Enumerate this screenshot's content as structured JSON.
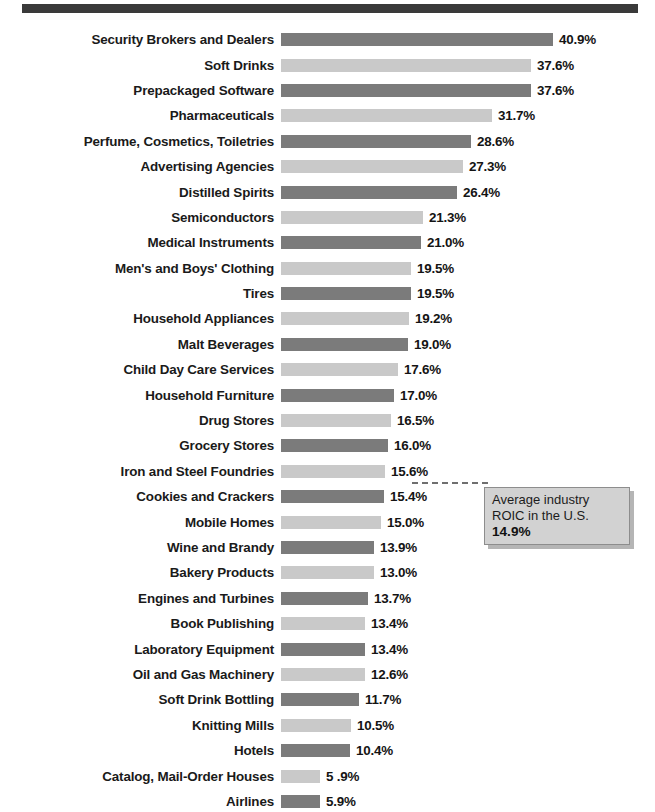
{
  "chart_data": {
    "type": "bar",
    "title": "",
    "xlabel": "",
    "ylabel": "",
    "orientation": "horizontal",
    "grid": false,
    "legend": null,
    "xlim": [
      0,
      40.9
    ],
    "value_suffix": "%",
    "categories": [
      "Security Brokers and Dealers",
      "Soft Drinks",
      "Prepackaged Software",
      "Pharmaceuticals",
      "Perfume, Cosmetics, Toiletries",
      "Advertising Agencies",
      "Distilled Spirits",
      "Semiconductors",
      "Medical Instruments",
      "Men's and Boys' Clothing",
      "Tires",
      "Household Appliances",
      "Malt Beverages",
      "Child Day Care Services",
      "Household Furniture",
      "Drug Stores",
      "Grocery Stores",
      "Iron and Steel Foundries",
      "Cookies and Crackers",
      "Mobile Homes",
      "Wine and Brandy",
      "Bakery Products",
      "Engines and Turbines",
      "Book Publishing",
      "Laboratory Equipment",
      "Oil and Gas Machinery",
      "Soft Drink Bottling",
      "Knitting Mills",
      "Hotels",
      "Catalog, Mail-Order Houses",
      "Airlines"
    ],
    "values": [
      40.9,
      37.6,
      37.6,
      31.7,
      28.6,
      27.3,
      26.4,
      21.3,
      21.0,
      19.5,
      19.5,
      19.2,
      19.0,
      17.6,
      17.0,
      16.5,
      16.0,
      15.6,
      15.4,
      15.0,
      13.9,
      13.0,
      13.7,
      13.4,
      13.4,
      12.6,
      11.7,
      10.5,
      10.4,
      5.9,
      5.9
    ],
    "value_labels": [
      "40.9%",
      "37.6%",
      "37.6%",
      "31.7%",
      "28.6%",
      "27.3%",
      "26.4%",
      "21.3%",
      "21.0%",
      "19.5%",
      "19.5%",
      "19.2%",
      "19.0%",
      "17.6%",
      "17.0%",
      "16.5%",
      "16.0%",
      "15.6%",
      "15.4%",
      "15.0%",
      "13.9%",
      "13.0%",
      "13.7%",
      "13.4%",
      "13.4%",
      "12.6%",
      "11.7%",
      "10.5%",
      "10.4%",
      "5 .9%",
      "5.9%"
    ],
    "bar_shades": [
      "dark",
      "light",
      "dark",
      "light",
      "dark",
      "light",
      "dark",
      "light",
      "dark",
      "light",
      "dark",
      "light",
      "dark",
      "light",
      "dark",
      "light",
      "dark",
      "light",
      "dark",
      "light",
      "dark",
      "light",
      "dark",
      "light",
      "dark",
      "light",
      "dark",
      "light",
      "dark",
      "light",
      "dark"
    ],
    "bar_widths_px": [
      272,
      250,
      250,
      211,
      190,
      182,
      176,
      142,
      140,
      130,
      130,
      128,
      127,
      117,
      113,
      110,
      107,
      104,
      103,
      100,
      93,
      93,
      87,
      84,
      84,
      84,
      78,
      70,
      69,
      39,
      39
    ],
    "annotation": {
      "line1": "Average industry",
      "line2": "ROIC in the U.S.",
      "value": "14.9%",
      "attached_between": [
        "Mobile Homes",
        "Wine and Brandy"
      ]
    },
    "colors": {
      "bar_dark": "#7b7b7b",
      "bar_light": "#c9c9c9",
      "rule": "#3a3a3a",
      "callout_fill": "#d2d2d2",
      "text": "#1a1a1a"
    }
  }
}
